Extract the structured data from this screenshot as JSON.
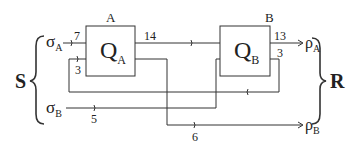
{
  "diagram": {
    "left_group": {
      "label": "S"
    },
    "right_group": {
      "label": "R"
    },
    "nodes": [
      {
        "id": "A",
        "box_label": "A",
        "symbol": "Q",
        "subscript": "A"
      },
      {
        "id": "B",
        "box_label": "B",
        "symbol": "Q",
        "subscript": "B"
      }
    ],
    "inputs": [
      {
        "symbol": "σ",
        "subscript": "A"
      },
      {
        "symbol": "σ",
        "subscript": "B"
      }
    ],
    "outputs": [
      {
        "symbol": "ρ",
        "subscript": "A"
      },
      {
        "symbol": "ρ",
        "subscript": "B"
      }
    ],
    "edge_labels": {
      "sigmaA_to_A": "7",
      "feedback_to_A": "3",
      "A_to_B": "14",
      "B_to_rhoA": "13",
      "B_feedback": "3",
      "sigmaB_to_B": "5",
      "A_to_rhoB": "6"
    }
  }
}
